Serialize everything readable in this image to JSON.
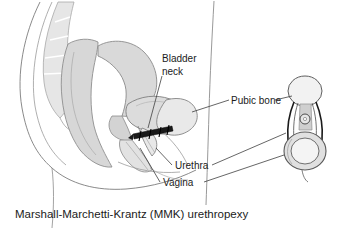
{
  "figure": {
    "title": "Marshall-Marchetti-Krantz (MMK) urethropexy",
    "type": "medical-illustration",
    "view": "mid-sagittal female pelvis with frontal pubic-bone inset",
    "caption": "Marshall-Marchetti-Krantz (MMK) urethropexy"
  },
  "labels": {
    "bladder_neck_line1": "Bladder",
    "bladder_neck_line2": "neck",
    "pubic_bone": "Pubic bone",
    "urethra": "Urethra",
    "vagina": "Vagina"
  },
  "anatomy": {
    "sacrum": "sacrum",
    "uterus": "uterus",
    "rectum": "rectum",
    "bladder": "bladder",
    "pubic_symphysis": "pubic-symphysis",
    "urethra": "urethra",
    "vagina": "vagina",
    "abdominal_wall": "abdominal-wall",
    "body_outline": "body-outline",
    "sutures": "retropubic-sutures"
  },
  "colors": {
    "background": "#ffffff",
    "outline": "#555555",
    "organ_fill": "#d9d9d9",
    "organ_fill_light": "#ededed",
    "bone_fill": "#e4e4e4",
    "suture_dark": "#1a1a1a",
    "text": "#1b1b1b",
    "leader_line": "#4a4a4a"
  }
}
